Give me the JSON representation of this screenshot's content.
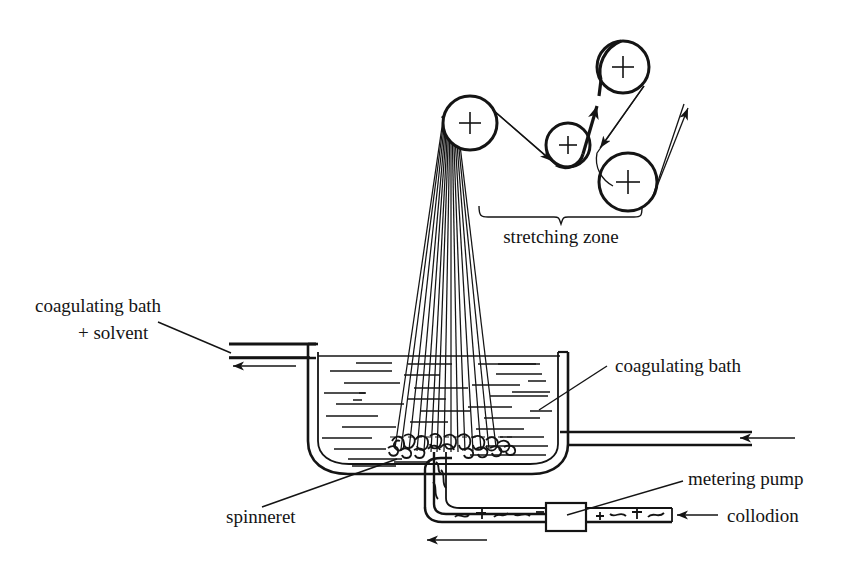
{
  "diagram": {
    "background_color": "#ffffff",
    "line_color": "#141414",
    "labels": {
      "stretching_zone": "stretching zone",
      "coagulating_bath_solvent_line1": "coagulating bath",
      "coagulating_bath_solvent_line2": "+ solvent",
      "coagulating_bath": "coagulating bath",
      "spinneret": "spinneret",
      "metering_pump": "metering pump",
      "collodion": "collodion"
    },
    "rollers": [
      {
        "name": "roller-1",
        "cx": 470,
        "cy": 123,
        "r": 27
      },
      {
        "name": "roller-2",
        "cx": 568,
        "cy": 145,
        "r": 22
      },
      {
        "name": "roller-3",
        "cx": 623,
        "cy": 67,
        "r": 26
      },
      {
        "name": "roller-4",
        "cx": 628,
        "cy": 182,
        "r": 29
      }
    ],
    "tank": {
      "left_wall_x": 308,
      "right_wall_x": 568,
      "top_y": 352,
      "bottom_y": 470,
      "liquid_level_y": 357
    },
    "flow_arrows": [
      {
        "name": "overflow-out-arrow",
        "direction": "left"
      },
      {
        "name": "bath-inlet-arrow",
        "direction": "left"
      },
      {
        "name": "collodion-inlet-arrow",
        "direction": "left"
      },
      {
        "name": "collodion-flow-arrow",
        "direction": "left"
      }
    ],
    "filament_count": 13
  }
}
